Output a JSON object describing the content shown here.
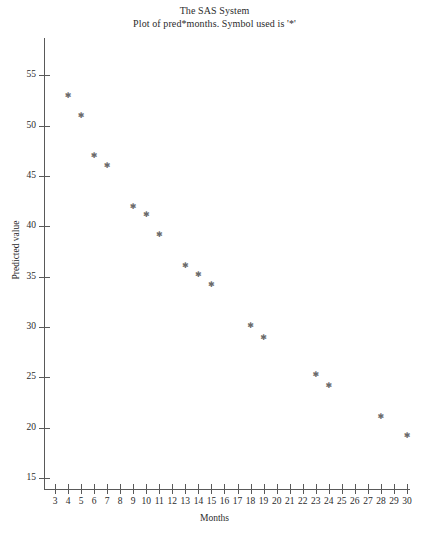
{
  "titles": {
    "line1": "The SAS System",
    "line2": "Plot of pred*months. Symbol used is '*'"
  },
  "axes": {
    "x_title": "Months",
    "y_title": "Predicted value"
  },
  "chart_data": {
    "type": "scatter",
    "title": "The SAS System",
    "subtitle": "Plot of pred*months. Symbol used is '*'",
    "xlabel": "Months",
    "ylabel": "Predicted value",
    "symbol": "*",
    "grid": false,
    "legend": "none",
    "xlim": [
      3,
      30
    ],
    "ylim": [
      15,
      57
    ],
    "xticks": [
      3,
      4,
      5,
      6,
      7,
      8,
      9,
      10,
      11,
      12,
      13,
      14,
      15,
      16,
      17,
      18,
      19,
      20,
      21,
      22,
      23,
      24,
      25,
      26,
      27,
      28,
      29,
      30
    ],
    "yticks": [
      15,
      20,
      25,
      30,
      35,
      40,
      45,
      50,
      55
    ],
    "x": [
      4,
      5,
      6,
      7,
      9,
      10,
      11,
      13,
      14,
      15,
      18,
      19,
      23,
      24,
      28,
      30
    ],
    "y": [
      53.0,
      51.0,
      47.0,
      46.0,
      42.0,
      41.2,
      39.2,
      36.1,
      35.2,
      34.2,
      30.1,
      29.0,
      25.3,
      24.2,
      21.1,
      19.2
    ],
    "points": [
      {
        "x": 4,
        "y": 53.0
      },
      {
        "x": 5,
        "y": 51.0
      },
      {
        "x": 6,
        "y": 47.0
      },
      {
        "x": 7,
        "y": 46.0
      },
      {
        "x": 9,
        "y": 42.0
      },
      {
        "x": 10,
        "y": 41.2
      },
      {
        "x": 11,
        "y": 39.2
      },
      {
        "x": 13,
        "y": 36.1
      },
      {
        "x": 14,
        "y": 35.2
      },
      {
        "x": 15,
        "y": 34.2
      },
      {
        "x": 18,
        "y": 30.1
      },
      {
        "x": 19,
        "y": 29.0
      },
      {
        "x": 23,
        "y": 25.3
      },
      {
        "x": 24,
        "y": 24.2
      },
      {
        "x": 28,
        "y": 21.1
      },
      {
        "x": 30,
        "y": 19.2
      }
    ],
    "marker_color": "#6b6b6b",
    "axis_color": "#595959",
    "text_color": "#2b2b2b",
    "background": "#ffffff"
  }
}
